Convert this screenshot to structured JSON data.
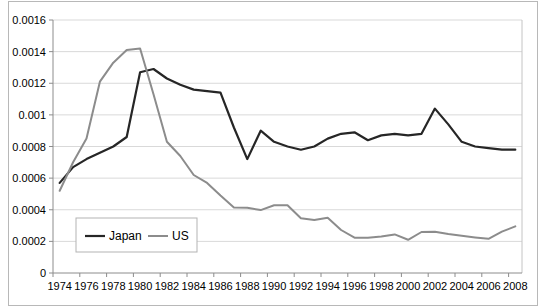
{
  "figure": {
    "width": 541,
    "height": 307,
    "background": "#ffffff",
    "frame_color": "#b8b8b8"
  },
  "chart_data": {
    "type": "line",
    "title": "",
    "xlabel": "",
    "ylabel": "",
    "x": [
      1974,
      1975,
      1976,
      1977,
      1978,
      1979,
      1980,
      1981,
      1982,
      1983,
      1984,
      1985,
      1986,
      1987,
      1988,
      1989,
      1990,
      1991,
      1992,
      1993,
      1994,
      1995,
      1996,
      1997,
      1998,
      1999,
      2000,
      2001,
      2002,
      2003,
      2004,
      2005,
      2006,
      2007,
      2008
    ],
    "series": [
      {
        "name": "Japan",
        "color": "#262626",
        "line_width": 2.2,
        "values": [
          0.00057,
          0.00067,
          0.00072,
          0.00076,
          0.0008,
          0.00086,
          0.00127,
          0.00129,
          0.00123,
          0.00119,
          0.00116,
          0.00115,
          0.00114,
          0.00092,
          0.00072,
          0.0009,
          0.00083,
          0.0008,
          0.00078,
          0.0008,
          0.00085,
          0.00088,
          0.00089,
          0.00084,
          0.00087,
          0.00088,
          0.00087,
          0.00088,
          0.00104,
          0.00094,
          0.00083,
          0.0008,
          0.00079,
          0.00078,
          0.00078
        ]
      },
      {
        "name": "US",
        "color": "#8c8c8c",
        "line_width": 2,
        "values": [
          0.00052,
          0.0007,
          0.00085,
          0.00121,
          0.00133,
          0.00141,
          0.00142,
          0.00113,
          0.00083,
          0.00074,
          0.00062,
          0.00057,
          0.00049,
          0.000415,
          0.000413,
          0.000398,
          0.000428,
          0.000428,
          0.000346,
          0.000335,
          0.00035,
          0.000272,
          0.000223,
          0.000223,
          0.00023,
          0.000244,
          0.00021,
          0.000259,
          0.000261,
          0.000246,
          0.000235,
          0.000225,
          0.000216,
          0.000262,
          0.000295
        ]
      }
    ],
    "ylim": [
      0,
      0.0016
    ],
    "yticks": [
      {
        "v": 0.0,
        "label": "0"
      },
      {
        "v": 0.0002,
        "label": "0.0002"
      },
      {
        "v": 0.0004,
        "label": "0.0004"
      },
      {
        "v": 0.0006,
        "label": "0.0006"
      },
      {
        "v": 0.0008,
        "label": "0.0008"
      },
      {
        "v": 0.001,
        "label": "0.001"
      },
      {
        "v": 0.0012,
        "label": "0.0012"
      },
      {
        "v": 0.0014,
        "label": "0.0014"
      },
      {
        "v": 0.0016,
        "label": "0.0016"
      }
    ],
    "xtick_labels": [
      "1974",
      "1976",
      "1978",
      "1980",
      "1982",
      "1984",
      "1986",
      "1988",
      "1990",
      "1992",
      "1994",
      "1996",
      "1998",
      "2000",
      "2002",
      "2004",
      "2006",
      "2008"
    ],
    "grid": true,
    "gridline_color": "#d9d9d9",
    "axis_color": "#8c8c8c",
    "plot_border_color": "#c4c4c4",
    "tick_label_color": "#000000",
    "tick_font_size": 11,
    "legend": {
      "position": "inside-bottom-left",
      "border_color": "#b3b3b3",
      "background": "#ffffff",
      "font_size": 12,
      "items": [
        "Japan",
        "US"
      ]
    }
  }
}
